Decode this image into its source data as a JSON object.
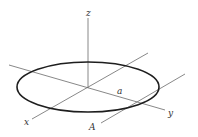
{
  "diagram": {
    "labels": {
      "z_axis": "z",
      "x_axis": "x",
      "y_axis": "y",
      "radius": "a",
      "point": "A"
    },
    "colors": {
      "axis": "#6a6a6a",
      "ring": "#1e1e1e",
      "label": "#333333"
    },
    "geometry": {
      "origin": [
        88,
        88
      ],
      "z_axis": {
        "x1": 88,
        "y1": 18,
        "x2": 88,
        "y2": 88
      },
      "y_axis": {
        "x1": 9,
        "y1": 65,
        "x2": 165,
        "y2": 110
      },
      "x_axis": {
        "x1": 32,
        "y1": 119,
        "x2": 148,
        "y2": 53
      },
      "a_line": {
        "x1": 101,
        "y1": 123,
        "x2": 185,
        "y2": 74
      },
      "ring": {
        "cx": 88,
        "cy": 87,
        "rx": 71,
        "ry": 25
      }
    }
  }
}
